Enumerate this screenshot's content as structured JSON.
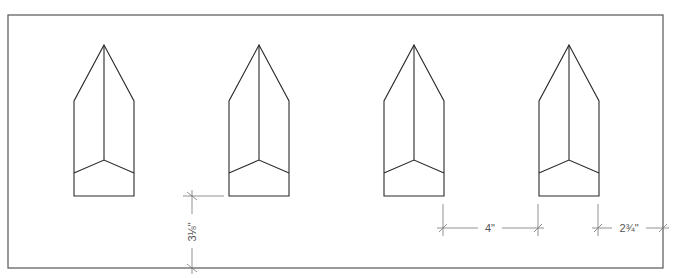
{
  "diagram": {
    "type": "technical drawing - plan view",
    "colors": {
      "line": "#2a2a2a",
      "dimension": "#777777",
      "border": "#555555",
      "background": "#ffffff"
    },
    "border": {
      "x": 8,
      "y": 15,
      "width": 655,
      "height": 253
    },
    "shapes": [
      {
        "id": "pointed-post-1",
        "cx": 104
      },
      {
        "id": "pointed-post-2",
        "cx": 259
      },
      {
        "id": "pointed-post-3",
        "cx": 414
      },
      {
        "id": "pointed-post-4",
        "cx": 569
      }
    ],
    "shape_geometry": {
      "half_width": 30,
      "apex_y": 45,
      "shoulder_y": 101,
      "fold_center_y": 160,
      "fold_side_y": 173,
      "bottom_y": 196
    },
    "dimensions": {
      "vertical_offset": {
        "label": "3⅛\"",
        "x": 192,
        "y1": 196,
        "y2": 268
      },
      "spacing": {
        "label": "4\"",
        "y": 228,
        "x1": 443,
        "x2": 538
      },
      "edge_offset": {
        "label": "2¾\"",
        "y": 228,
        "x1": 598,
        "x2": 663
      }
    }
  }
}
